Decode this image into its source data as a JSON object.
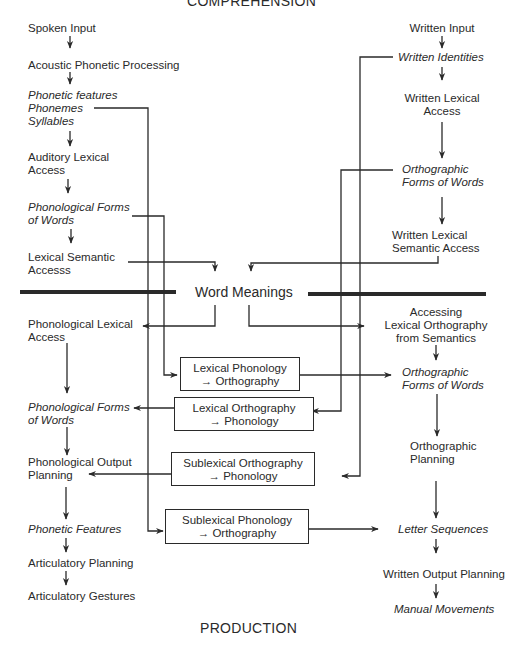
{
  "titles": {
    "top": "COMPREHENSION",
    "bottom": "PRODUCTION"
  },
  "center": {
    "label": "Word Meanings"
  },
  "left_comprehension": [
    {
      "text": "Spoken Input",
      "italic": false
    },
    {
      "text": "Acoustic Phonetic Processing",
      "italic": false
    },
    {
      "text": "Phonetic features",
      "italic": true
    },
    {
      "text": "Phonemes",
      "italic": true
    },
    {
      "text": "Syllables",
      "italic": true
    },
    {
      "text": "Auditory Lexical",
      "italic": false
    },
    {
      "text": "Access",
      "italic": false
    },
    {
      "text": "Phonological Forms",
      "italic": true
    },
    {
      "text": "of Words",
      "italic": true
    },
    {
      "text": "Lexical Semantic",
      "italic": false
    },
    {
      "text": "Accesss",
      "italic": false
    }
  ],
  "right_comprehension": [
    {
      "text": "Written Input",
      "italic": false
    },
    {
      "text": "Written Identities",
      "italic": true
    },
    {
      "text": "Written Lexical",
      "italic": false
    },
    {
      "text": "Access",
      "italic": false
    },
    {
      "text": "Orthographic",
      "italic": true
    },
    {
      "text": "Forms of Words",
      "italic": true
    },
    {
      "text": "Written Lexical",
      "italic": false
    },
    {
      "text": "Semantic Access",
      "italic": false
    }
  ],
  "left_production": [
    {
      "text": "Phonological Lexical",
      "italic": false
    },
    {
      "text": "Access",
      "italic": false
    },
    {
      "text": "Phonological Forms",
      "italic": true
    },
    {
      "text": "of Words",
      "italic": true
    },
    {
      "text": "Phonological Output",
      "italic": false
    },
    {
      "text": "Planning",
      "italic": false
    },
    {
      "text": "Phonetic Features",
      "italic": true
    },
    {
      "text": "Articulatory Planning",
      "italic": false
    },
    {
      "text": "Articulatory Gestures",
      "italic": false
    }
  ],
  "right_production": [
    {
      "text": "Accessing",
      "italic": false
    },
    {
      "text": "Lexical Orthography",
      "italic": false
    },
    {
      "text": "from Semantics",
      "italic": false
    },
    {
      "text": "Orthographic",
      "italic": true
    },
    {
      "text": "Forms of Words",
      "italic": true
    },
    {
      "text": "Orthographic",
      "italic": false
    },
    {
      "text": "Planning",
      "italic": false
    },
    {
      "text": "Letter Sequences",
      "italic": true
    },
    {
      "text": "Written Output Planning",
      "italic": false
    },
    {
      "text": "Manual Movements",
      "italic": true
    }
  ],
  "conversion_boxes": [
    {
      "line1": "Lexical Phonology",
      "line2": "→ Orthography"
    },
    {
      "line1": "Lexical Orthography",
      "line2": "→ Phonology"
    },
    {
      "line1": "Sublexical Orthography",
      "line2": "→ Phonology"
    },
    {
      "line1": "Sublexical Phonology",
      "line2": "→ Orthography"
    }
  ],
  "colors": {
    "line": "#2a2a2a",
    "text": "#2a2a2a",
    "background": "#ffffff"
  }
}
